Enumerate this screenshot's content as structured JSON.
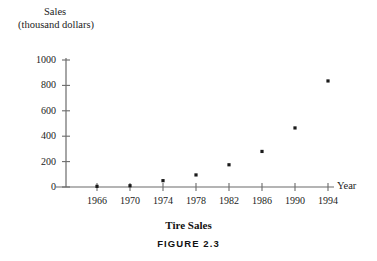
{
  "figure": {
    "caption": "FIGURE 2.3",
    "title": "Tire Sales"
  },
  "axes": {
    "y_title_line1": "Sales",
    "y_title_line2": "(thousand dollars)",
    "x_title": "Year"
  },
  "colors": {
    "axis": "#6b6b6b",
    "point": "#1a1a1a",
    "text": "#1b1b1b",
    "background": "#ffffff"
  },
  "chart_data": {
    "type": "scatter",
    "title": "Tire Sales",
    "xlabel": "Year",
    "ylabel": "Sales (thousand dollars)",
    "x": [
      1966,
      1970,
      1974,
      1978,
      1982,
      1986,
      1990,
      1994
    ],
    "values": [
      5,
      10,
      50,
      95,
      175,
      280,
      465,
      835
    ],
    "xticks": [
      "1966",
      "1970",
      "1974",
      "1978",
      "1982",
      "1986",
      "1990",
      "1994"
    ],
    "yticks": [
      "0",
      "200",
      "400",
      "600",
      "800",
      "1000"
    ],
    "ytick_values": [
      0,
      200,
      400,
      600,
      800,
      1000
    ],
    "xlim": [
      1963,
      1997
    ],
    "ylim": [
      0,
      1000
    ],
    "grid": false,
    "legend": "none"
  }
}
